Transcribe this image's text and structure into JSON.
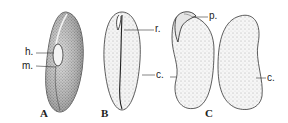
{
  "figure": {
    "panels": [
      {
        "id": "A",
        "caption": "A",
        "labels": [
          {
            "key": "h",
            "text": "h."
          },
          {
            "key": "m",
            "text": "m."
          }
        ]
      },
      {
        "id": "B",
        "caption": "B",
        "labels": [
          {
            "key": "r",
            "text": "r."
          },
          {
            "key": "c",
            "text": "c."
          }
        ]
      },
      {
        "id": "C",
        "caption": "C",
        "labels": [
          {
            "key": "p",
            "text": "p."
          },
          {
            "key": "c",
            "text": "c."
          }
        ]
      }
    ],
    "colors": {
      "ink": "#222222",
      "stipple": "#555555",
      "background": "#ffffff"
    }
  }
}
